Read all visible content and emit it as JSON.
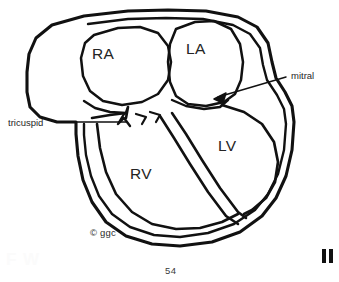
{
  "figure": {
    "type": "anatomical-line-diagram",
    "stroke_color": "#111111",
    "background_color": "#ffffff"
  },
  "chambers": [
    {
      "id": "ra",
      "label": "RA",
      "name": "right-atrium"
    },
    {
      "id": "la",
      "label": "LA",
      "name": "left-atrium"
    },
    {
      "id": "rv",
      "label": "RV",
      "name": "right-ventricle"
    },
    {
      "id": "lv",
      "label": "LV",
      "name": "left-ventricle"
    }
  ],
  "annotations": [
    {
      "id": "tricuspid",
      "label": "tricuspid",
      "name": "tricuspid-valve-label"
    },
    {
      "id": "mitral",
      "label": "mitral",
      "name": "mitral-valve-label"
    }
  ],
  "marks": {
    "copyright": "© ggc",
    "page_number": "54",
    "ghost_text": "F W"
  }
}
